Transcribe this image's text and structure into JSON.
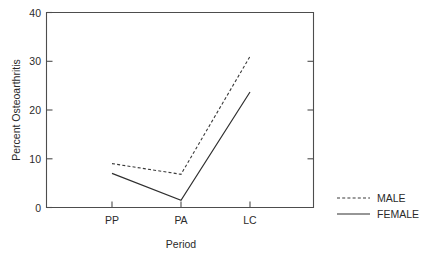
{
  "chart_data": {
    "type": "line",
    "title": "",
    "xlabel": "Period",
    "ylabel": "Percent Osteoarthritis",
    "categories": [
      "PP",
      "PA",
      "LC"
    ],
    "series": [
      {
        "name": "MALE",
        "style": "dashed",
        "values": [
          9,
          6.8,
          31
        ]
      },
      {
        "name": "FEMALE",
        "style": "solid",
        "values": [
          7,
          1.5,
          23.7
        ]
      }
    ],
    "ylim": [
      0,
      40
    ],
    "yticks": [
      0,
      10,
      20,
      30,
      40
    ],
    "ytick_labels": [
      "0",
      "10",
      "20",
      "30",
      "40"
    ],
    "xtick_labels": [
      "PP",
      "PA",
      "LC"
    ],
    "grid": false,
    "legend_position": "right-outside",
    "legend": [
      {
        "label": "MALE",
        "style": "dashed"
      },
      {
        "label": "FEMALE",
        "style": "solid"
      }
    ],
    "colors": {
      "axis": "#4d4d4d",
      "male_line": "#3a3a3a",
      "female_line": "#2f2f2f",
      "text": "#2b2b2b",
      "background": "#ffffff"
    }
  },
  "axis": {
    "y_title": "Percent Osteoarthritis",
    "x_title": "Period",
    "y_ticks": [
      "40",
      "30",
      "20",
      "10",
      "0"
    ],
    "x_ticks": [
      "PP",
      "PA",
      "LC"
    ]
  },
  "legend": {
    "male_label": "MALE",
    "female_label": "FEMALE"
  }
}
